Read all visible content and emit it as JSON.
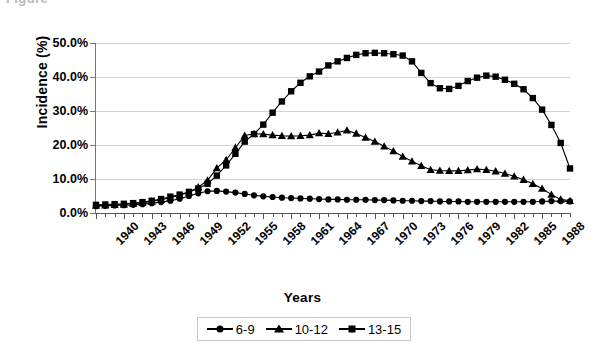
{
  "figure": {
    "cropped_caption_fragment": "Figure"
  },
  "chart_data": {
    "type": "line",
    "title": "",
    "xlabel": "Years",
    "ylabel": "Incidence (%)",
    "xlim": [
      1940,
      1991
    ],
    "ylim": [
      0,
      50
    ],
    "ytick_step": 10,
    "ytick_labels": [
      "0.0%",
      "10.0%",
      "20.0%",
      "30.0%",
      "40.0%",
      "50.0%"
    ],
    "ytick_values": [
      0,
      10,
      20,
      30,
      40,
      50
    ],
    "xtick_labels": [
      "1940",
      "1943",
      "1946",
      "1949",
      "1952",
      "1955",
      "1958",
      "1961",
      "1964",
      "1967",
      "1970",
      "1973",
      "1976",
      "1979",
      "1982",
      "1985",
      "1988"
    ],
    "xtick_values": [
      1940,
      1943,
      1946,
      1949,
      1952,
      1955,
      1958,
      1961,
      1964,
      1967,
      1970,
      1973,
      1976,
      1979,
      1982,
      1985,
      1988
    ],
    "grid": "horizontal",
    "legend_position": "bottom-center",
    "x": [
      1940,
      1941,
      1942,
      1943,
      1944,
      1945,
      1946,
      1947,
      1948,
      1949,
      1950,
      1951,
      1952,
      1953,
      1954,
      1955,
      1956,
      1957,
      1958,
      1959,
      1960,
      1961,
      1962,
      1963,
      1964,
      1965,
      1966,
      1967,
      1968,
      1969,
      1970,
      1971,
      1972,
      1973,
      1974,
      1975,
      1976,
      1977,
      1978,
      1979,
      1980,
      1981,
      1982,
      1983,
      1984,
      1985,
      1986,
      1987,
      1988,
      1989,
      1990,
      1991
    ],
    "series": [
      {
        "name": "6-9",
        "marker": "circle",
        "color": "#000000",
        "values": [
          2.0,
          2.1,
          2.2,
          2.3,
          2.4,
          2.6,
          2.9,
          3.2,
          3.6,
          4.2,
          5.0,
          5.8,
          6.4,
          6.5,
          6.3,
          6.0,
          5.6,
          5.2,
          4.9,
          4.7,
          4.5,
          4.4,
          4.3,
          4.2,
          4.1,
          4.0,
          4.0,
          3.9,
          3.9,
          3.9,
          3.8,
          3.8,
          3.7,
          3.6,
          3.6,
          3.5,
          3.5,
          3.4,
          3.4,
          3.4,
          3.3,
          3.3,
          3.3,
          3.3,
          3.3,
          3.3,
          3.3,
          3.3,
          3.4,
          3.5,
          3.5,
          3.4
        ]
      },
      {
        "name": "10-12",
        "marker": "triangle",
        "color": "#000000",
        "values": [
          2.2,
          2.3,
          2.4,
          2.5,
          2.7,
          3.0,
          3.4,
          3.9,
          4.5,
          5.2,
          6.1,
          7.6,
          9.6,
          13.2,
          15.6,
          19.2,
          22.8,
          23.3,
          23.2,
          22.9,
          22.7,
          22.6,
          22.7,
          22.9,
          23.5,
          23.3,
          23.7,
          24.3,
          23.4,
          22.2,
          21.0,
          19.6,
          18.2,
          16.6,
          15.2,
          13.9,
          12.7,
          12.5,
          12.4,
          12.4,
          12.6,
          12.9,
          12.7,
          12.3,
          11.6,
          10.8,
          9.8,
          8.6,
          7.2,
          5.4,
          4.0,
          3.6
        ]
      },
      {
        "name": "13-15",
        "marker": "square",
        "color": "#000000",
        "values": [
          2.4,
          2.5,
          2.6,
          2.7,
          2.9,
          3.2,
          3.6,
          4.1,
          4.8,
          5.4,
          6.2,
          7.2,
          8.6,
          11.0,
          14.0,
          17.4,
          21.0,
          23.2,
          26.0,
          29.5,
          32.8,
          35.8,
          38.3,
          40.2,
          41.6,
          43.4,
          44.6,
          45.6,
          46.5,
          47.0,
          47.1,
          47.0,
          46.7,
          46.3,
          44.6,
          41.2,
          38.2,
          36.7,
          36.5,
          37.4,
          38.8,
          39.8,
          40.4,
          40.1,
          39.2,
          38.0,
          36.4,
          33.8,
          30.4,
          25.9,
          20.6,
          13.1
        ]
      }
    ]
  },
  "legend": {
    "items": [
      {
        "label": "6-9",
        "marker": "circle"
      },
      {
        "label": "10-12",
        "marker": "triangle"
      },
      {
        "label": "13-15",
        "marker": "square"
      }
    ]
  }
}
